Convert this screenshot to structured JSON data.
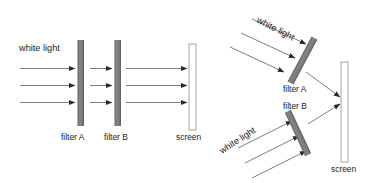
{
  "figure": {
    "background_color": "#ffffff",
    "width": 379,
    "height": 183,
    "colors": {
      "filter_fill": "#787878",
      "filter_edge": "#5a5a5a",
      "screen_stroke": "#9a9a9a",
      "screen_fill": "#ffffff",
      "ray_stroke": "#6f6f6f",
      "arrow_head": "#2a2a2a",
      "text": "#1a1a1a"
    }
  },
  "left_diagram": {
    "name": "inline-filters-setup",
    "source_label": "white light",
    "filters": [
      {
        "id": "A",
        "label": "filter A"
      },
      {
        "id": "B",
        "label": "filter B"
      }
    ],
    "screen_label": "screen",
    "ray_count_before_filter_a": 3,
    "ray_count_between_filters": 3,
    "ray_count_after_filter_b": 3
  },
  "right_diagram": {
    "name": "angled-filters-setup",
    "upper": {
      "source_label": "white light",
      "filter_label": "filter A",
      "ray_count": 3
    },
    "lower": {
      "source_label": "white light",
      "filter_label": "filter B",
      "ray_count": 3
    },
    "screen_label": "screen",
    "transmitted_ray_count": 2
  }
}
